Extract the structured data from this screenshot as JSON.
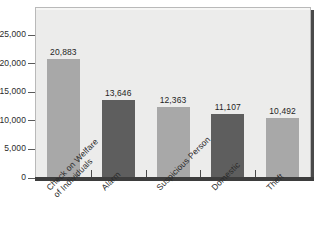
{
  "chart_data": {
    "type": "bar",
    "title": "",
    "subtitle": "",
    "xlabel": "",
    "ylabel": "",
    "categories": [
      "Check on Welfare\nof Individuals",
      "Alarm",
      "Suspicious Person",
      "Domestic",
      "Theft"
    ],
    "values": [
      20883,
      13646,
      12363,
      11107,
      10492
    ],
    "value_labels": [
      "20,883",
      "13,646",
      "12,363",
      "11,107",
      "10,492"
    ],
    "bar_colors": [
      "#a8a8a8",
      "#5e5e5e",
      "#a8a8a8",
      "#5e5e5e",
      "#a8a8a8"
    ],
    "ylim": [
      0,
      26500
    ],
    "yticks": [
      0,
      5000,
      10000,
      15000,
      20000,
      25000
    ],
    "ytick_labels": [
      "0",
      "5,000",
      "10,000",
      "15,000",
      "20,000",
      "25,000"
    ],
    "grid": false,
    "legend": null,
    "plot_background": "#ececeb"
  }
}
